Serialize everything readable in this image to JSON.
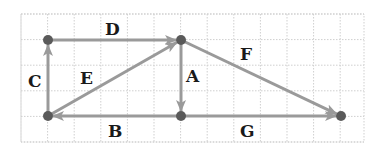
{
  "diagram": {
    "type": "vector-diagram-on-grid",
    "grid": {
      "x0": 21,
      "y0": 14,
      "x1": 364,
      "y1": 142,
      "cell": 26.6,
      "color": "#cfcfcf"
    },
    "colors": {
      "vector": "#9a9a9a",
      "point": "#5a5a5a",
      "label": "#1a1a1a"
    },
    "points": [
      {
        "id": "P1",
        "x": 48,
        "y": 116
      },
      {
        "id": "P2",
        "x": 48,
        "y": 40
      },
      {
        "id": "P3",
        "x": 181,
        "y": 40
      },
      {
        "id": "P4",
        "x": 181,
        "y": 116
      },
      {
        "id": "P5",
        "x": 341,
        "y": 116
      }
    ],
    "vectors": [
      {
        "label": "A",
        "from": "P3",
        "to": "P4",
        "label_x": 186,
        "label_y": 82
      },
      {
        "label": "B",
        "from": "P4",
        "to": "P1",
        "label_x": 108,
        "label_y": 137
      },
      {
        "label": "C",
        "from": "P1",
        "to": "P2",
        "label_x": 28,
        "label_y": 87
      },
      {
        "label": "D",
        "from": "P2",
        "to": "P3",
        "label_x": 105,
        "label_y": 35
      },
      {
        "label": "E",
        "from": "P1",
        "to": "P3",
        "label_x": 80,
        "label_y": 84
      },
      {
        "label": "F",
        "from": "P3",
        "to": "P5",
        "label_x": 240,
        "label_y": 60
      },
      {
        "label": "G",
        "from": "P4",
        "to": "P5",
        "label_x": 240,
        "label_y": 137
      }
    ]
  }
}
